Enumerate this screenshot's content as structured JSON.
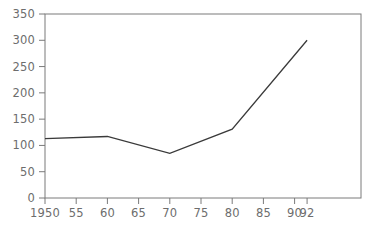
{
  "chart_data": {
    "type": "line",
    "title": "",
    "xlabel": "",
    "ylabel": "",
    "x": [
      1950,
      1960,
      1970,
      1980,
      1992
    ],
    "values": [
      113,
      117,
      85,
      131,
      300
    ],
    "series": [
      {
        "name": "series-1",
        "values": [
          113,
          117,
          85,
          131,
          300
        ]
      }
    ],
    "ylim": [
      0,
      350
    ],
    "yticks": [
      0,
      50,
      100,
      150,
      200,
      250,
      300,
      350
    ],
    "ytick_labels": [
      "0",
      "50",
      "100",
      "150",
      "200",
      "250",
      "300",
      "350"
    ],
    "xtick_values": [
      1950,
      1955,
      1960,
      1965,
      1970,
      1975,
      1980,
      1985,
      1990,
      1992
    ],
    "xtick_labels": [
      "1950",
      "55",
      "60",
      "65",
      "70",
      "75",
      "80",
      "85",
      "90",
      "92"
    ],
    "grid": false,
    "legend": "none",
    "line_color": "#3a3a3a",
    "axis_color": "#7a7a7a",
    "label_color": "#6d6d6d",
    "background_color": "#ffffff"
  }
}
